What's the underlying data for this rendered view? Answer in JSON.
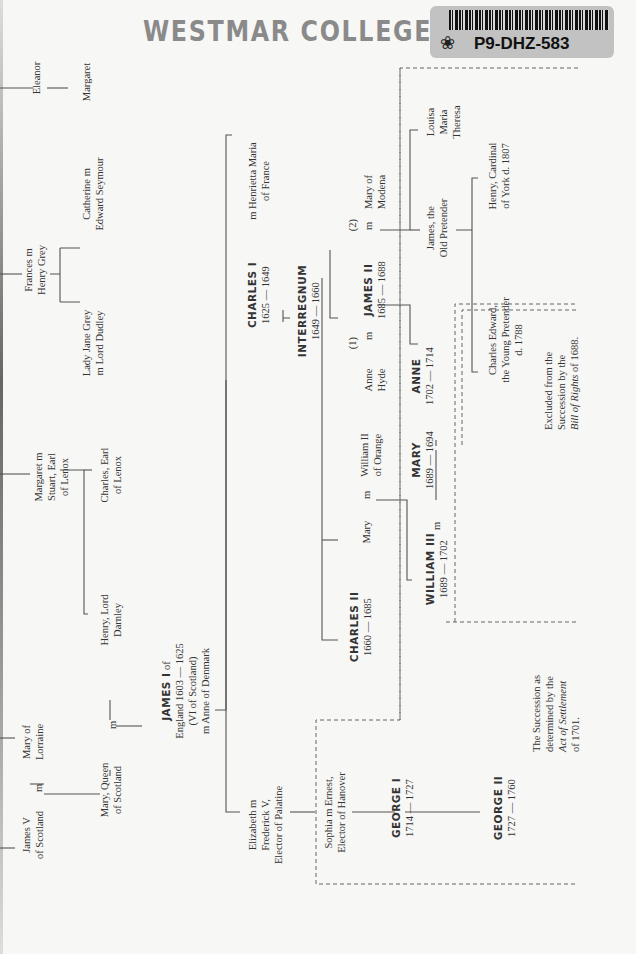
{
  "stamp": {
    "text": "WESTMAR COLLEGE LI",
    "label_code": "P9-DHZ-583",
    "label_icon": "leaf-icon"
  },
  "chart": {
    "people": {
      "eleanor": [
        "Eleanor"
      ],
      "margaret_top": [
        "Margaret"
      ],
      "frances": [
        "Frances m",
        "Henry Grey"
      ],
      "catherine": [
        "Catherine m",
        "Edward Seymour"
      ],
      "jane_grey": [
        "Lady Jane Grey",
        "m Lord Dudley"
      ],
      "margaret_stuart": [
        "Margaret m",
        "Stuart, Earl",
        "of Lenox"
      ],
      "charles_lenox": [
        "Charles, Earl",
        "of Lenox"
      ],
      "darnley": [
        "Henry, Lord",
        "Darnley"
      ],
      "james_v": [
        "James V",
        "of Scotland"
      ],
      "mary_lorraine": [
        "Mary of",
        "Lorraine"
      ],
      "mary_queen": [
        "Mary, Queen",
        "of Scotland"
      ],
      "james_i": {
        "name": "JAMES I",
        "lines": [
          "of",
          "England 1603 — 1625",
          "(VI of Scotland)",
          "m Anne of Denmark"
        ]
      },
      "elizabeth": [
        "Elizabeth m",
        "Frederick V,",
        "Elector of Palatine"
      ],
      "sophia": [
        "Sophia m Ernest,",
        "Elector of Hanover"
      ],
      "george_i": {
        "name": "GEORGE I",
        "reign": "1714 — 1727"
      },
      "george_ii": {
        "name": "GEORGE II",
        "reign": "1727 — 1760"
      },
      "charles_i": {
        "name": "CHARLES I",
        "reign": "1625 — 1649",
        "spouse": [
          "m  Henrietta Maria",
          "of France"
        ]
      },
      "interregnum": {
        "name": "INTERREGNUM",
        "reign": "1649 — 1660"
      },
      "charles_ii": {
        "name": "CHARLES II",
        "reign": "1660 — 1685"
      },
      "mary_orange": "Mary",
      "william_ii": [
        "William II",
        "of Orange"
      ],
      "william_iii": {
        "name": "WILLIAM III",
        "reign": "1689 — 1702"
      },
      "mary_ii": {
        "name": "MARY",
        "reign": "1689 — 1694"
      },
      "anne_hyde": [
        "Anne",
        "Hyde"
      ],
      "james_ii": {
        "name": "JAMES II",
        "reign": "1685 — 1688"
      },
      "mary_modena": [
        "Mary of",
        "Modena"
      ],
      "anne": {
        "name": "ANNE",
        "reign": "1702 — 1714"
      },
      "marriage_1": "(1)",
      "marriage_2": "(2)",
      "m": "m",
      "old_pretender": [
        "James, the",
        "Old Pretender"
      ],
      "louisa": [
        "Louisa",
        "Maria",
        "Theresa"
      ],
      "henry_cardinal": [
        "Henry, Cardinal",
        "of York d. 1807"
      ],
      "charles_edward": [
        "Charles Edward,",
        "the Young Pretender",
        "d. 1788"
      ]
    },
    "notes": {
      "excluded": [
        "Excluded from the",
        "Succession by the"
      ],
      "excluded_italic": "Bill of Rights",
      "excluded_tail": " of 1688.",
      "settlement": [
        "The Succession as",
        "determined by the"
      ],
      "settlement_italic": "Act of Settlement",
      "settlement_tail": "of 1701."
    }
  }
}
